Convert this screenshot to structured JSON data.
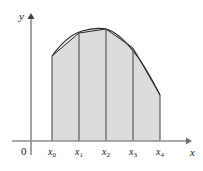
{
  "figure": {
    "background_color": "#ffffff"
  },
  "axes": {
    "y_axis_label": "y",
    "x_axis_label": "x",
    "origin_label": "0",
    "axis_color": "#8c8c8c",
    "x_axis_pixel_y": 141,
    "y_axis_pixel_x": 31,
    "x_axis_start_x": 12,
    "x_axis_end_x": 190,
    "y_axis_start_y": 14,
    "y_axis_end_y": 155
  },
  "ticks": [
    {
      "label": "x",
      "subscript": "0",
      "pixel_x": 52
    },
    {
      "label": "x",
      "subscript": "1",
      "pixel_x": 79
    },
    {
      "label": "x",
      "subscript": "2",
      "pixel_x": 106
    },
    {
      "label": "x",
      "subscript": "3",
      "pixel_x": 133
    },
    {
      "label": "x",
      "subscript": "4",
      "pixel_x": 160
    }
  ],
  "region": {
    "fill_color": "#dcdcdc",
    "divider_color": "#595959",
    "curve_color": "#262626",
    "chord_color": "#262626"
  },
  "chart_data": {
    "type": "area",
    "xlabel": "x",
    "ylabel": "y",
    "x_tick_labels": [
      "x0",
      "x1",
      "x2",
      "x3",
      "x4"
    ],
    "x_pixels": [
      52,
      79,
      106,
      133,
      160
    ],
    "curve_top_pixels_y": [
      56,
      33,
      29,
      48,
      95
    ],
    "baseline_pixel_y": 141,
    "bar_heights_pixels": [
      85,
      108,
      112,
      93,
      46
    ],
    "curve_samples": [
      [
        52,
        56
      ],
      [
        57,
        49
      ],
      [
        63,
        43
      ],
      [
        69,
        38
      ],
      [
        75,
        35
      ],
      [
        81,
        32
      ],
      [
        88,
        30
      ],
      [
        94,
        29
      ],
      [
        100,
        29
      ],
      [
        106,
        29
      ],
      [
        112,
        31
      ],
      [
        118,
        34
      ],
      [
        124,
        38
      ],
      [
        130,
        44
      ],
      [
        136,
        52
      ],
      [
        142,
        61
      ],
      [
        148,
        72
      ],
      [
        154,
        83
      ],
      [
        160,
        95
      ]
    ],
    "chord_points": [
      [
        52,
        56
      ],
      [
        79,
        33
      ],
      [
        106,
        29
      ],
      [
        133,
        48
      ],
      [
        160,
        95
      ]
    ],
    "grid": false,
    "legend": "none"
  }
}
